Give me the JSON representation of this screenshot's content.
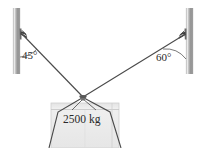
{
  "figure": {
    "background_color": "#ffffff",
    "width": 206,
    "height": 148
  },
  "labels": {
    "angle_left": "45°",
    "angle_right": "60°",
    "mass": "2500 kg"
  },
  "geometry": {
    "left_pole": {
      "x": 13,
      "y_top": 8,
      "width": 7,
      "height": 66
    },
    "right_pole": {
      "x": 186,
      "y_top": 8,
      "width": 7,
      "height": 66
    },
    "left_anchor": {
      "x": 21,
      "y": 33
    },
    "right_anchor": {
      "x": 186,
      "y": 34
    },
    "knot": {
      "x": 83,
      "y": 97
    },
    "crate": {
      "x": 51,
      "y": 103,
      "width": 68,
      "height": 45
    }
  },
  "colors": {
    "pole_light": "#e8e8e8",
    "pole_mid": "#9a9a9a",
    "pole_dark": "#6e6e6e",
    "cable": "#4a4a4a",
    "crate_fill": "#ececec",
    "crate_edge": "#b8b8b8",
    "text": "#2a2a2a"
  }
}
